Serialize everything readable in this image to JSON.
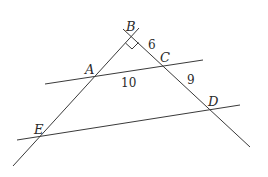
{
  "diagram": {
    "type": "geometry-figure",
    "points": {
      "B": {
        "label": "B",
        "x": 132,
        "y": 36
      },
      "A": {
        "label": "A",
        "x": 95,
        "y": 75
      },
      "C": {
        "label": "C",
        "x": 162,
        "y": 66
      },
      "D": {
        "label": "D",
        "x": 211,
        "y": 110
      },
      "E": {
        "label": "E",
        "x": 40,
        "y": 136
      }
    },
    "segment_labels": {
      "BC": "6",
      "AC": "10",
      "CD": "9"
    },
    "right_angle_at": "B",
    "lines": [
      {
        "name": "line-BE",
        "through": [
          "B",
          "A",
          "E"
        ]
      },
      {
        "name": "line-BD",
        "through": [
          "B",
          "C",
          "D"
        ]
      },
      {
        "name": "line-AC",
        "through": [
          "A",
          "C"
        ]
      },
      {
        "name": "line-ED",
        "through": [
          "E",
          "D"
        ]
      }
    ],
    "colors": {
      "stroke": "#3a3a3a",
      "text": "#2a2a2a",
      "background": "#ffffff"
    }
  }
}
